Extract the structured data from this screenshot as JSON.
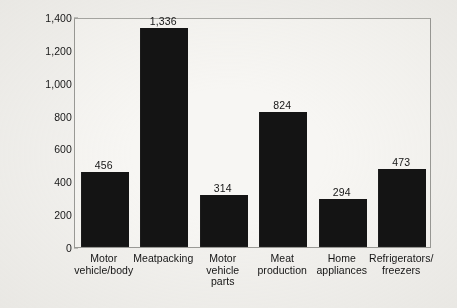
{
  "chart_data": {
    "type": "bar",
    "title": "",
    "subtitle": "",
    "xlabel": "",
    "ylabel": "Number of Disorders",
    "categories": [
      "Motor vehicle/body",
      "Meatpacking",
      "Motor vehicle parts",
      "Meat production",
      "Home appliances",
      "Refrigerators/ freezers"
    ],
    "category_lines": [
      [
        "Motor",
        "vehicle/body"
      ],
      [
        "Meatpacking"
      ],
      [
        "Motor",
        "vehicle",
        "parts"
      ],
      [
        "Meat",
        "production"
      ],
      [
        "Home",
        "appliances"
      ],
      [
        "Refrigerators/",
        "freezers"
      ]
    ],
    "values": [
      456,
      1336,
      314,
      824,
      294,
      473
    ],
    "value_labels": [
      "456",
      "1,336",
      "314",
      "824",
      "294",
      "473"
    ],
    "ylim": [
      0,
      1400
    ],
    "ytick_values": [
      0,
      200,
      400,
      600,
      800,
      1000,
      1200,
      1400
    ],
    "ytick_labels": [
      "0",
      "200",
      "400",
      "600",
      "800",
      "1,000",
      "1,200",
      "1,400"
    ],
    "grid": false,
    "legend": null,
    "bar_color": "#141414",
    "frame_color": "#9b9b97",
    "background_color": "#f3f2ef",
    "plot_background_color": "#f7f6f3"
  }
}
